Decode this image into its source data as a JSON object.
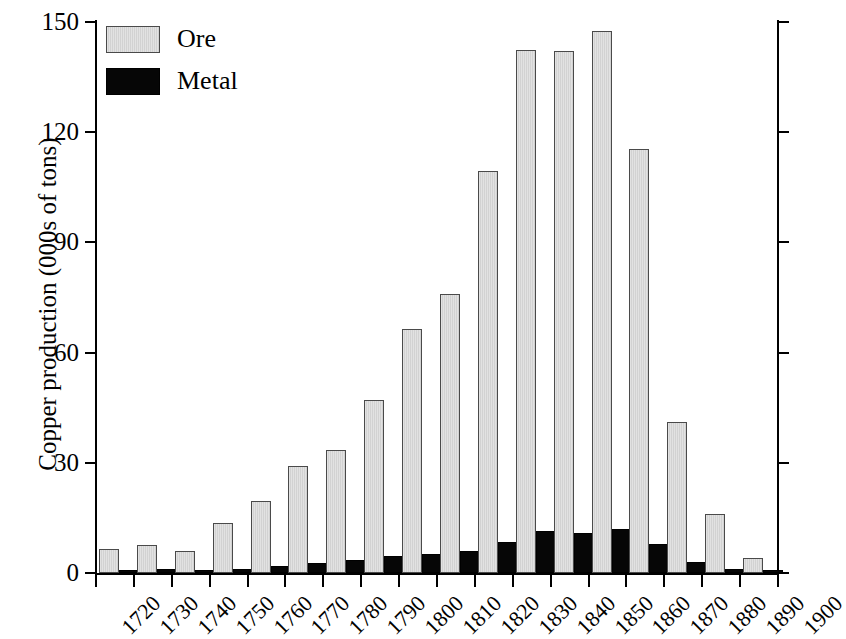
{
  "chart_data": {
    "type": "bar",
    "title": "",
    "subtitle": "",
    "xlabel": "",
    "ylabel": "Copper production (000s of tons)",
    "categories": [
      "1720",
      "1730",
      "1740",
      "1750",
      "1760",
      "1770",
      "1780",
      "1790",
      "1800",
      "1810",
      "1820",
      "1830",
      "1840",
      "1850",
      "1860",
      "1870",
      "1880",
      "1890"
    ],
    "x_tick_labels": [
      "1720",
      "1730",
      "1740",
      "1750",
      "1760",
      "1770",
      "1780",
      "1790",
      "1800",
      "1810",
      "1820",
      "1830",
      "1840",
      "1850",
      "1860",
      "1870",
      "1880",
      "1890",
      "1900"
    ],
    "y_tick_labels": [
      "0",
      "30",
      "60",
      "90",
      "120",
      "150"
    ],
    "y_ticks": [
      0,
      30,
      60,
      90,
      120,
      150
    ],
    "ylim": [
      0,
      150
    ],
    "grid": false,
    "legend_position": "top-left",
    "series": [
      {
        "name": "Ore",
        "color": "#dcdcdc",
        "values": [
          6.5,
          7.5,
          6.0,
          13.5,
          19.5,
          29.0,
          33.5,
          47.0,
          66.5,
          76.0,
          109.5,
          142.5,
          142.0,
          147.5,
          115.5,
          41.0,
          16.0,
          4.0
        ]
      },
      {
        "name": "Metal",
        "color": "#060606",
        "values": [
          0.8,
          1.0,
          0.8,
          1.2,
          1.8,
          2.6,
          3.6,
          4.6,
          5.2,
          6.0,
          8.5,
          11.5,
          11.0,
          12.0,
          7.8,
          3.0,
          1.2,
          0.4
        ]
      }
    ]
  },
  "legend": {
    "items": [
      {
        "label": "Ore",
        "swatch": "ore-swatch"
      },
      {
        "label": "Metal",
        "swatch": "metal-swatch"
      }
    ]
  },
  "axes": {
    "y_title": "Copper production (000s of tons)"
  }
}
